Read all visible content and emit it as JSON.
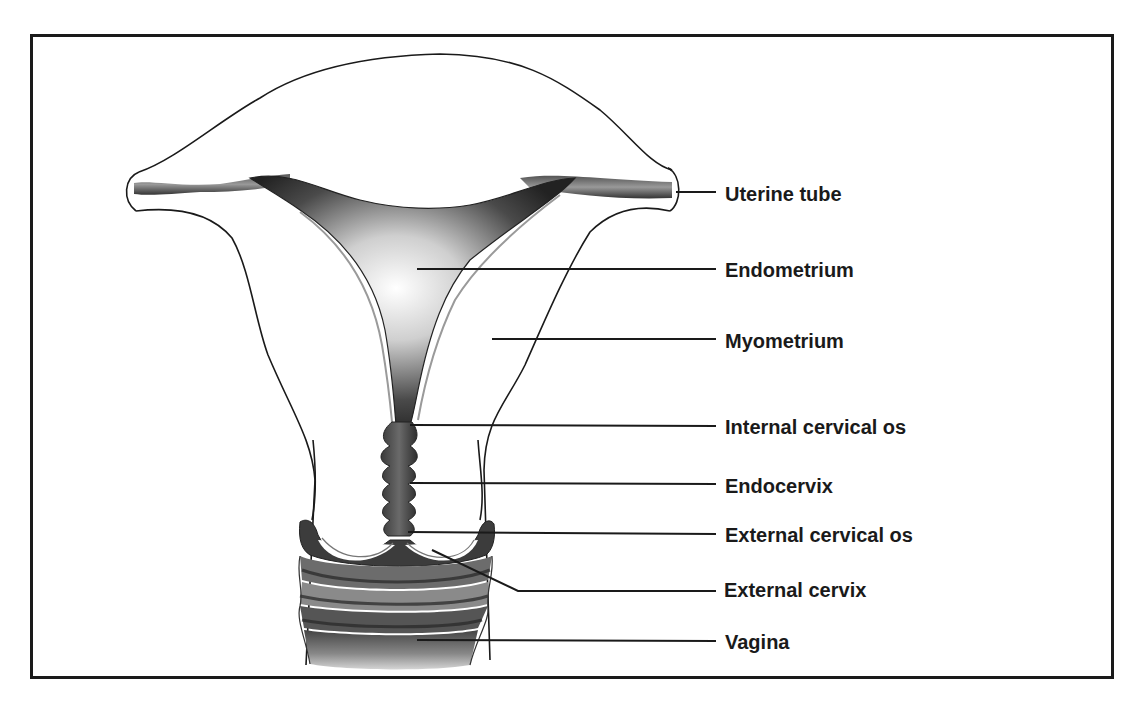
{
  "diagram": {
    "type": "anatomical-illustration",
    "colors": {
      "ink": "#1a1a1a",
      "shade_dark": "#2b2b2b",
      "shade_mid": "#6e6e6e",
      "shade_light": "#d8d8d8",
      "background": "#ffffff"
    },
    "labels": [
      {
        "id": "uterine-tube",
        "text": "Uterine tube",
        "x": 725,
        "y": 184,
        "line": {
          "x1": 676,
          "y1": 192,
          "x2": 716,
          "y2": 192
        }
      },
      {
        "id": "endometrium",
        "text": "Endometrium",
        "x": 725,
        "y": 262,
        "line": {
          "x1": 417,
          "y1": 269,
          "x2": 716,
          "y2": 269
        }
      },
      {
        "id": "myometrium",
        "text": "Myometrium",
        "x": 725,
        "y": 333,
        "line": {
          "x1": 492,
          "y1": 339,
          "x2": 716,
          "y2": 339
        }
      },
      {
        "id": "internal-cervical-os",
        "text": "Internal cervical os",
        "x": 725,
        "y": 419,
        "line": {
          "x1": 410,
          "y1": 425,
          "x2": 716,
          "y2": 426
        }
      },
      {
        "id": "endocervix",
        "text": "Endocervix",
        "x": 725,
        "y": 478,
        "line": {
          "x1": 410,
          "y1": 483,
          "x2": 716,
          "y2": 484
        }
      },
      {
        "id": "external-cervical-os",
        "text": "External cervical os",
        "x": 725,
        "y": 527,
        "line": {
          "x1": 408,
          "y1": 532,
          "x2": 716,
          "y2": 534
        }
      },
      {
        "id": "external-cervix",
        "text": "External cervix",
        "x": 724,
        "y": 580,
        "line": {
          "x1": 432,
          "y1": 550,
          "x2": 518,
          "y2": 591,
          "x3": 716,
          "y3": 591
        }
      },
      {
        "id": "vagina",
        "text": "Vagina",
        "x": 725,
        "y": 634,
        "line": {
          "x1": 417,
          "y1": 640,
          "x2": 716,
          "y2": 641
        }
      }
    ]
  }
}
